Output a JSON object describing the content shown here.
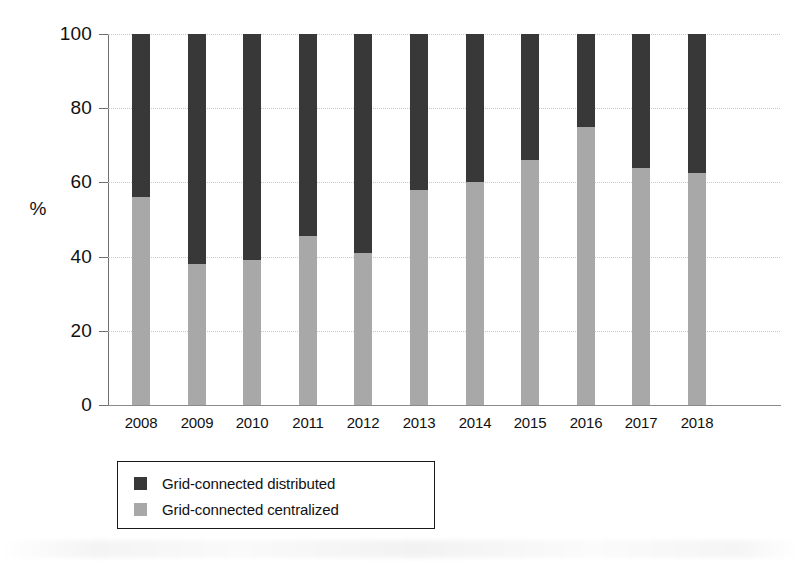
{
  "chart_data": {
    "type": "bar",
    "subtype": "stacked-100-percent",
    "title": "",
    "xlabel": "",
    "ylabel": "%",
    "ylim": [
      0,
      100
    ],
    "yticks": [
      0,
      20,
      40,
      60,
      80,
      100
    ],
    "ytick_labels": [
      "0",
      "20",
      "40",
      "60",
      "80",
      "100"
    ],
    "grid": "horizontal-dotted",
    "legend_position": "below-axes-left",
    "categories": [
      "2008",
      "2009",
      "2010",
      "2011",
      "2012",
      "2013",
      "2014",
      "2015",
      "2016",
      "2017",
      "2018"
    ],
    "series": [
      {
        "name": "Grid-connected distributed",
        "color": "#383838",
        "values": [
          44,
          62,
          61,
          54.5,
          59,
          42,
          40,
          34,
          25,
          36,
          37.5
        ]
      },
      {
        "name": "Grid-connected centralized",
        "color": "#a8a8a8",
        "values": [
          56,
          38,
          39,
          45.5,
          41,
          58,
          60,
          66,
          75,
          64,
          62.5
        ]
      }
    ]
  },
  "axes": {
    "y_label": "%",
    "y_ticks": [
      {
        "value": 100,
        "label": "100"
      },
      {
        "value": 80,
        "label": "80"
      },
      {
        "value": 60,
        "label": "60"
      },
      {
        "value": 40,
        "label": "40"
      },
      {
        "value": 20,
        "label": "20"
      },
      {
        "value": 0,
        "label": "0"
      }
    ],
    "x_ticks": [
      {
        "label": "2008"
      },
      {
        "label": "2009"
      },
      {
        "label": "2010"
      },
      {
        "label": "2011"
      },
      {
        "label": "2012"
      },
      {
        "label": "2013"
      },
      {
        "label": "2014"
      },
      {
        "label": "2015"
      },
      {
        "label": "2016"
      },
      {
        "label": "2017"
      },
      {
        "label": "2018"
      }
    ]
  },
  "legend": {
    "entries": [
      {
        "label": "Grid-connected distributed",
        "color": "#383838"
      },
      {
        "label": "Grid-connected centralized",
        "color": "#a8a8a8"
      }
    ]
  },
  "colors": {
    "distributed": "#383838",
    "centralized": "#a8a8a8",
    "axis": "#6f6f6f",
    "grid": "#c9c9c9",
    "text": "#111111",
    "background": "#ffffff"
  }
}
